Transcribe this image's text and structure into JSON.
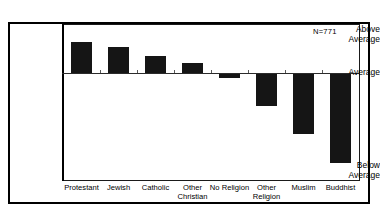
{
  "figure": {
    "n_annotation": "N=771",
    "bar_color": "#151515",
    "frame_color": "#000000",
    "background": "#ffffff"
  },
  "chart_data": {
    "type": "bar",
    "title": "",
    "subtitle": "",
    "xlabel": "",
    "ylabel": "",
    "categories": [
      "Protestant",
      "Jewish",
      "Catholic",
      "Other\nChristian",
      "No Religion",
      "Other\nReligion",
      "Muslim",
      "Buddhist"
    ],
    "values": [
      0.68,
      0.58,
      0.38,
      0.23,
      -0.08,
      -0.66,
      -1.24,
      -1.83
    ],
    "ylim": [
      -2.0,
      1.0
    ],
    "ytick_values": [
      1.0,
      0.0,
      -2.0
    ],
    "ytick_labels": [
      "Above\nAverage",
      "Average",
      "Below\nAverage"
    ],
    "grid": false,
    "legend": null,
    "annotations": [
      "N=771"
    ],
    "baseline": 0.0,
    "orientation": "vertical"
  },
  "axis": {
    "y_above_average": "Above\nAverage",
    "y_average": "Average",
    "y_below_average": "Below\nAverage"
  },
  "x_labels": {
    "protestant": "Protestant",
    "jewish": "Jewish",
    "catholic": "Catholic",
    "other_christian": "Other\nChristian",
    "no_religion": "No Religion",
    "other_religion": "Other\nReligion",
    "muslim": "Muslim",
    "buddhist": "Buddhist"
  }
}
